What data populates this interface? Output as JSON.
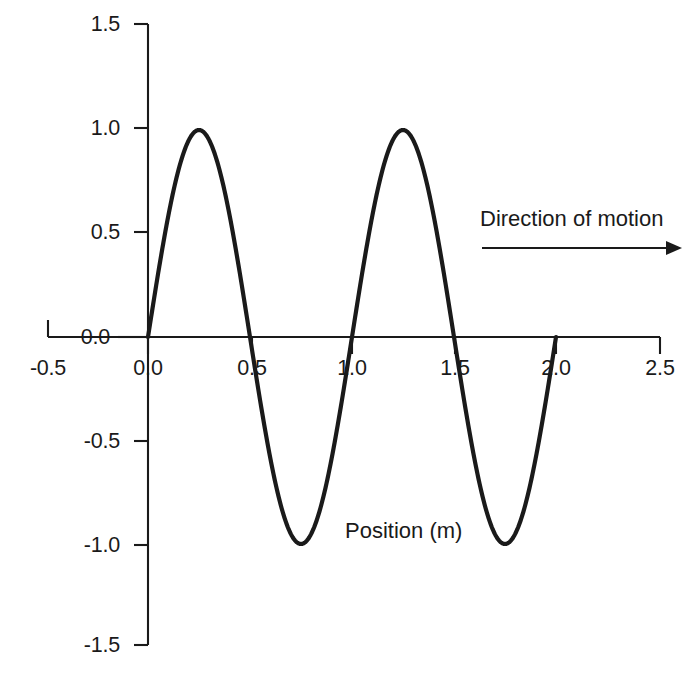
{
  "chart_data": {
    "type": "line",
    "title": "",
    "subtitle": "",
    "xlabel": "",
    "ylabel": "",
    "series": [
      {
        "name": "wave",
        "description": "Transverse sinusoidal wave, amplitude 1.0 m, wavelength 1.0 m",
        "amplitude": 1.0,
        "wavelength": 1.0,
        "x_start": 0.0,
        "x_end": 2.0,
        "key_points": [
          {
            "x": 0.0,
            "y": 0.0
          },
          {
            "x": 0.25,
            "y": 1.0
          },
          {
            "x": 0.5,
            "y": 0.0
          },
          {
            "x": 0.75,
            "y": -1.0
          },
          {
            "x": 1.0,
            "y": 0.0
          },
          {
            "x": 1.25,
            "y": 1.0
          },
          {
            "x": 1.5,
            "y": 0.0
          },
          {
            "x": 1.75,
            "y": -1.0
          },
          {
            "x": 2.0,
            "y": 0.0
          }
        ]
      }
    ],
    "xticks": [
      "-0.5",
      "0.0",
      "0.5",
      "1.0",
      "1.5",
      "2.0",
      "2.5"
    ],
    "xtick_values": [
      -0.5,
      0.0,
      0.5,
      1.0,
      1.5,
      2.0,
      2.5
    ],
    "yticks": [
      "1.5",
      "1.0",
      "0.5",
      "0.0",
      "-0.5",
      "-1.0",
      "-1.5"
    ],
    "ytick_values": [
      1.5,
      1.0,
      0.5,
      0.0,
      -0.5,
      -1.0,
      -1.5
    ],
    "xlim": [
      -0.5,
      2.5
    ],
    "ylim": [
      -1.5,
      1.5
    ],
    "grid": false,
    "legend": false,
    "annotations": [
      {
        "name": "direction-of-motion",
        "text": "Direction of motion",
        "x": 1.65,
        "y": 0.63
      },
      {
        "name": "position-axis-label",
        "text": "Position (m)",
        "x": 1.0,
        "y": -0.87
      }
    ],
    "line_color": "#1a1a1a",
    "axis_color": "#1a1a1a",
    "background_color": "#ffffff"
  },
  "axes": {
    "y_ticks": [
      {
        "label": "1.5"
      },
      {
        "label": "1.0"
      },
      {
        "label": "0.5"
      },
      {
        "label": "0.0"
      },
      {
        "label": "-0.5"
      },
      {
        "label": "-1.0"
      },
      {
        "label": "-1.5"
      }
    ],
    "x_ticks": [
      {
        "label": "-0.5"
      },
      {
        "label": "0.0"
      },
      {
        "label": "0.5"
      },
      {
        "label": "1.0"
      },
      {
        "label": "1.5"
      },
      {
        "label": "2.0"
      },
      {
        "label": "2.5"
      }
    ]
  },
  "annotations": {
    "direction_of_motion": "Direction of motion",
    "position_label": "Position (m)"
  }
}
